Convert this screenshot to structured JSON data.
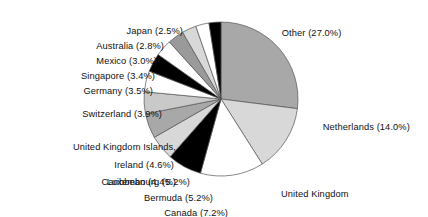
{
  "chart_data": {
    "type": "pie",
    "title": "",
    "subtitle": "",
    "xlabel": "",
    "ylabel": "",
    "legend_position": "none",
    "labels_inline": true,
    "start_angle_deg": 0,
    "direction": "clockwise",
    "categories": [
      "Other",
      "Netherlands",
      "United Kingdom",
      "Canada",
      "Bermuda",
      "Luxembourg",
      "Ireland",
      "United Kingdom Islands, Caribbean",
      "Switzerland",
      "Germany",
      "Singapore",
      "Mexico",
      "Australia",
      "Japan"
    ],
    "values": [
      27.0,
      14.0,
      13.3,
      7.2,
      5.2,
      5.2,
      4.6,
      4.4,
      3.9,
      3.5,
      3.4,
      3.0,
      2.8,
      2.5
    ],
    "units": "percent",
    "colors": [
      "#a8a8a8",
      "#d8d8d8",
      "#ffffff",
      "#000000",
      "#d8d8d8",
      "#a8a8a8",
      "#c9c9c9",
      "#ffffff",
      "#000000",
      "#ffffff",
      "#9a9a9a",
      "#d8d8d8",
      "#ffffff",
      "#000000"
    ],
    "slice_edge_color": "#555555",
    "annotations": [
      {
        "key": "other",
        "text": "Other (27.0%)",
        "side": "right"
      },
      {
        "key": "netherlands",
        "text": "Netherlands (14.0%)",
        "side": "right"
      },
      {
        "key": "uk_line1",
        "text": "United Kingdom",
        "side": "right"
      },
      {
        "key": "uk_line2",
        "text": "(13.3%)",
        "side": "right"
      },
      {
        "key": "canada",
        "text": "Canada (7.2%)",
        "side": "left"
      },
      {
        "key": "bermuda",
        "text": "Bermuda (5.2%)",
        "side": "left"
      },
      {
        "key": "luxembourg",
        "text": "Luxembourg (5.2%)",
        "side": "left"
      },
      {
        "key": "ireland",
        "text": "Ireland (4.6%)",
        "side": "left"
      },
      {
        "key": "ukic_line1",
        "text": "United Kingdom Islands,",
        "side": "left"
      },
      {
        "key": "ukic_line2",
        "text": "Caribbean (4.4%)",
        "side": "left"
      },
      {
        "key": "switzerland",
        "text": "Switzerland (3.9%)",
        "side": "left"
      },
      {
        "key": "germany",
        "text": "Germany (3.5%)",
        "side": "left"
      },
      {
        "key": "singapore",
        "text": "Singapore (3.4%)",
        "side": "left"
      },
      {
        "key": "mexico",
        "text": "Mexico (3.0%)",
        "side": "left"
      },
      {
        "key": "australia",
        "text": "Australia (2.8%)",
        "side": "left"
      },
      {
        "key": "japan",
        "text": "Japan (2.5%)",
        "side": "left"
      }
    ]
  },
  "labels": {
    "other": "Other (27.0%)",
    "netherlands": "Netherlands (14.0%)",
    "united_kingdom_line1": "United Kingdom",
    "united_kingdom_line2": "(13.3%)",
    "canada": "Canada (7.2%)",
    "bermuda": "Bermuda (5.2%)",
    "luxembourg": "Luxembourg (5.2%)",
    "ireland": "Ireland (4.6%)",
    "uk_islands_line1": "United Kingdom Islands,",
    "uk_islands_line2": "Caribbean (4.4%)",
    "switzerland": "Switzerland (3.9%)",
    "germany": "Germany (3.5%)",
    "singapore": "Singapore (3.4%)",
    "mexico": "Mexico (3.0%)",
    "australia": "Australia (2.8%)",
    "japan": "Japan (2.5%)"
  }
}
